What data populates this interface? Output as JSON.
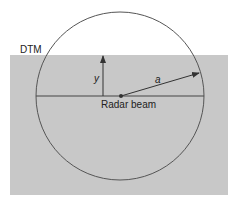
{
  "diagram": {
    "labels": {
      "dtm": "DTM",
      "y": "y",
      "a": "a",
      "radar_beam": "Radar beam"
    },
    "colors": {
      "dtm_fill": "#c8c8c8",
      "stroke": "#333333",
      "background": "#ffffff"
    }
  }
}
